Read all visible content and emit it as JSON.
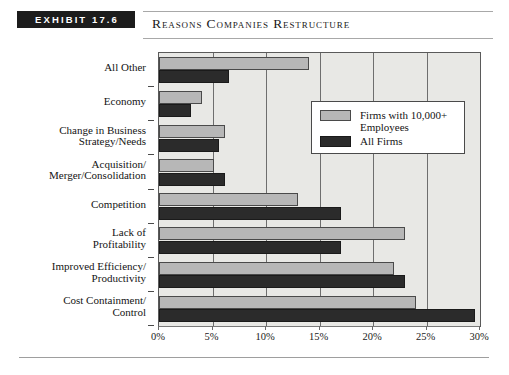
{
  "header": {
    "exhibit_badge": "EXHIBIT 17.6",
    "title": "Reasons Companies Restructure"
  },
  "chart_data": {
    "type": "bar",
    "orientation": "horizontal",
    "title": "Reasons Companies Restructure",
    "xlabel": "",
    "ylabel": "",
    "xlim": [
      0,
      30
    ],
    "xunit": "%",
    "grid": true,
    "legend_position": "upper-right-inside",
    "xticks": [
      "0%",
      "5%",
      "10%",
      "15%",
      "20%",
      "25%",
      "30%"
    ],
    "xtick_values": [
      0,
      5,
      10,
      15,
      20,
      25,
      30
    ],
    "categories": [
      "All Other",
      "Economy",
      "Change in Business\nStrategy/Needs",
      "Acquisition/\nMerger/Consolidation",
      "Competition",
      "Lack of\nProfitability",
      "Improved Efficiency/\nProductivity",
      "Cost Containment/\nControl"
    ],
    "series": [
      {
        "name": "Firms with 10,000+\nEmployees",
        "color": "#b7b7b7",
        "values": [
          14.0,
          4.0,
          6.2,
          5.1,
          13.0,
          23.0,
          22.0,
          24.0
        ]
      },
      {
        "name": "All Firms",
        "color": "#2b2b2b",
        "values": [
          6.5,
          3.0,
          5.6,
          6.2,
          17.0,
          17.0,
          23.0,
          29.5
        ]
      }
    ]
  },
  "legend": {
    "entries": [
      {
        "label": "Firms with 10,000+\nEmployees",
        "swatch": "light"
      },
      {
        "label": "All Firms",
        "swatch": "dark"
      }
    ]
  }
}
